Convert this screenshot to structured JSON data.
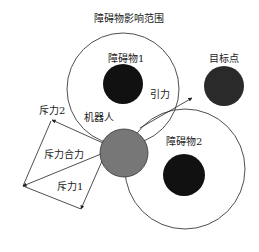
{
  "diagram": {
    "title": "障碍物影响范围",
    "labels": {
      "obstacle1": "障碍物1",
      "obstacle2": "障碍物2",
      "target": "目标点",
      "robot": "机器人",
      "attraction": "引力",
      "repulsion1": "斥力1",
      "repulsion2": "斥力2",
      "repulsion_resultant": "斥力合力"
    },
    "colors": {
      "obstacle": "#111111",
      "target": "#2a2a2a",
      "robot": "#777777",
      "line": "#222222"
    }
  }
}
